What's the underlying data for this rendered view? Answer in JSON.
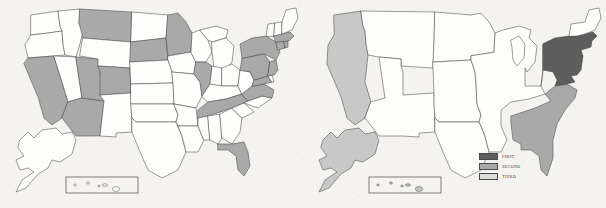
{
  "figure": {
    "type": "choropleth-map-pair",
    "background_color": "#f4f3f0",
    "panel_count": 2
  },
  "colors": {
    "first": "#5d5d5d",
    "second": "#a9a9a9",
    "third": "#c8c8c8",
    "unshaded": "#fdfdfb",
    "outline": "#4a4a4a",
    "background": "#f4f3f0"
  },
  "legend": {
    "visible_on_panel": "right",
    "items": [
      {
        "label": "FIRST",
        "color": "#5d5d5d",
        "rank": 1
      },
      {
        "label": "SECOND",
        "color": "#a9a9a9",
        "rank": 2
      },
      {
        "label": "THIRD",
        "color": "#dcdcdc",
        "rank": 3
      }
    ]
  },
  "left_map": {
    "title": "",
    "unit": "state",
    "shaded_states": [
      "California",
      "Arizona",
      "Utah",
      "Colorado",
      "Montana",
      "South Dakota",
      "Minnesota",
      "Illinois",
      "Tennessee",
      "Florida",
      "Virginia",
      "Maryland",
      "Pennsylvania",
      "New York",
      "New Jersey",
      "Connecticut",
      "Rhode Island",
      "Massachusetts"
    ],
    "unshaded_states": [
      "Washington",
      "Oregon",
      "Idaho",
      "Nevada",
      "Wyoming",
      "New Mexico",
      "North Dakota",
      "Nebraska",
      "Kansas",
      "Oklahoma",
      "Texas",
      "Iowa",
      "Missouri",
      "Arkansas",
      "Louisiana",
      "Wisconsin",
      "Michigan",
      "Indiana",
      "Ohio",
      "Kentucky",
      "Mississippi",
      "Alabama",
      "Georgia",
      "South Carolina",
      "North Carolina",
      "West Virginia",
      "Delaware",
      "Vermont",
      "New Hampshire",
      "Maine",
      "Alaska",
      "Hawaii"
    ],
    "insets": [
      "Alaska",
      "Hawaii"
    ]
  },
  "right_map": {
    "title": "",
    "unit": "region",
    "regions": [
      {
        "name": "Northeast",
        "rank_label": "FIRST",
        "color": "#5d5d5d"
      },
      {
        "name": "South Atlantic",
        "rank_label": "SECOND",
        "color": "#a9a9a9"
      },
      {
        "name": "Pacific",
        "rank_label": "THIRD",
        "color": "#c8c8c8"
      },
      {
        "name": "Interior",
        "rank_label": "",
        "color": "#fdfdfb"
      }
    ],
    "insets": [
      "Alaska",
      "Hawaii"
    ],
    "alaska_shading": "THIRD",
    "hawaii_shading": "THIRD"
  }
}
